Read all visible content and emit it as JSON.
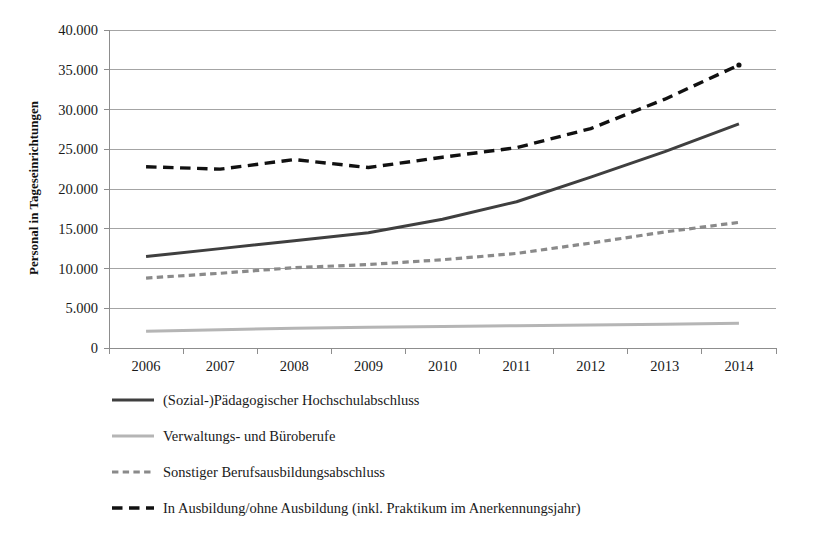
{
  "chart_data": {
    "type": "line",
    "title": "",
    "subtitle": "",
    "xlabel": "",
    "ylabel": "Personal in Tageseinrichtungen",
    "categories": [
      "2006",
      "2007",
      "2008",
      "2009",
      "2010",
      "2011",
      "2012",
      "2013",
      "2014"
    ],
    "x": [
      2006,
      2007,
      2008,
      2009,
      2010,
      2011,
      2012,
      2013,
      2014
    ],
    "ylim": [
      0,
      40000
    ],
    "ytick_step": 5000,
    "ytick_labels": [
      "0",
      "5.000",
      "10.000",
      "15.000",
      "20.000",
      "25.000",
      "30.000",
      "35.000",
      "40.000"
    ],
    "ytick_values": [
      0,
      5000,
      10000,
      15000,
      20000,
      25000,
      30000,
      35000,
      40000
    ],
    "grid": true,
    "grid_axis": "y",
    "legend_position": "below",
    "series": [
      {
        "name": "(Sozial-)Pädagogischer Hochschulabschluss",
        "values": [
          11500,
          12500,
          13500,
          14500,
          16200,
          18400,
          21500,
          24700,
          28200
        ],
        "color": "#3f3f3f",
        "style": "solid",
        "width": 3.0
      },
      {
        "name": "Verwaltungs- und Büroberufe",
        "values": [
          2100,
          2300,
          2500,
          2600,
          2700,
          2800,
          2900,
          3000,
          3100
        ],
        "color": "#b5b5b5",
        "style": "solid",
        "width": 3.0
      },
      {
        "name": "Sonstiger Berufsausbildungsabschluss",
        "values": [
          8800,
          9400,
          10100,
          10500,
          11100,
          11900,
          13200,
          14600,
          15800
        ],
        "color": "#8a8a8a",
        "style": "dashed-short",
        "width": 3.2
      },
      {
        "name": "In Ausbildung/ohne Ausbildung (inkl. Praktikum im Anerkennungsjahr)",
        "values": [
          22800,
          22500,
          23700,
          22700,
          24000,
          25200,
          27600,
          31300,
          35600
        ],
        "color": "#111111",
        "style": "dashed-long",
        "width": 3.4
      }
    ]
  },
  "legend": {
    "items": [
      {
        "label": "(Sozial-)Pädagogischer Hochschulabschluss"
      },
      {
        "label": "Verwaltungs- und Büroberufe"
      },
      {
        "label": "Sonstiger Berufsausbildungsabschluss"
      },
      {
        "label": "In Ausbildung/ohne Ausbildung (inkl. Praktikum im Anerkennungsjahr)"
      }
    ]
  }
}
